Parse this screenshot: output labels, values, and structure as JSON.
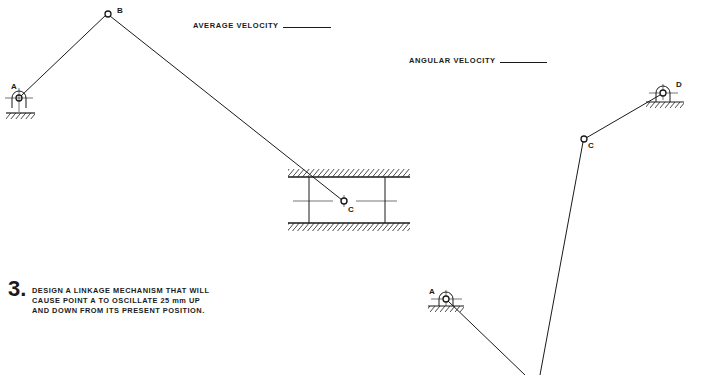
{
  "labels": {
    "average_velocity": "AVERAGE  VELOCITY",
    "angular_velocity": "ANGULAR  VELOCITY"
  },
  "slider_crank": {
    "points": {
      "A": "A",
      "B": "B",
      "C": "C"
    }
  },
  "four_bar": {
    "points": {
      "A": "A",
      "C": "C",
      "D": "D"
    }
  },
  "problem": {
    "number": "3.",
    "lines": [
      "DESIGN A LINKAGE MECHANISM THAT WILL",
      "CAUSE POINT A TO OSCILLATE 25 mm UP",
      "AND DOWN FROM ITS PRESENT POSITION."
    ]
  },
  "colors": {
    "ink": "#1a1a1a",
    "paper": "#ffffff"
  }
}
